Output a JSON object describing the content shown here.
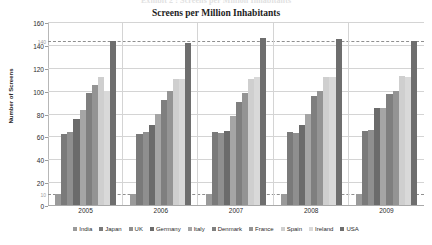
{
  "figure_caption": "Exhibit 2 : Screens per Million Inhabitants",
  "chart_data": {
    "type": "bar",
    "title": "Screens per Million Inhabitants",
    "xlabel": "",
    "ylabel": "Number of Screens",
    "ylim": [
      0,
      160
    ],
    "ytick_step": 20,
    "yticks": [
      0,
      20,
      40,
      60,
      80,
      100,
      120,
      140,
      160
    ],
    "grid": true,
    "legend_position": "bottom",
    "categories": [
      "2005",
      "2006",
      "2007",
      "2008",
      "2009"
    ],
    "reference_lines": [
      {
        "label": "140",
        "value": 143,
        "style": "dashed"
      },
      {
        "label": "10",
        "value": 10,
        "style": "dashed"
      }
    ],
    "series": [
      {
        "name": "India",
        "color": "#9a9a9a",
        "values": [
          10,
          10,
          10,
          10,
          10
        ]
      },
      {
        "name": "Japan",
        "color": "#7a7a7a",
        "values": [
          62,
          62,
          64,
          64,
          65
        ]
      },
      {
        "name": "UK",
        "color": "#8f8f8f",
        "values": [
          64,
          64,
          63,
          63,
          66
        ]
      },
      {
        "name": "Germany",
        "color": "#6b6b6b",
        "values": [
          75,
          70,
          65,
          70,
          85
        ]
      },
      {
        "name": "Italy",
        "color": "#a5a5a5",
        "values": [
          83,
          80,
          78,
          80,
          85
        ]
      },
      {
        "name": "Denmark",
        "color": "#7f7f7f",
        "values": [
          98,
          92,
          90,
          95,
          97
        ]
      },
      {
        "name": "France",
        "color": "#949494",
        "values": [
          105,
          100,
          98,
          100,
          100
        ]
      },
      {
        "name": "Spain",
        "color": "#cfcfcf",
        "values": [
          112,
          110,
          110,
          112,
          113
        ]
      },
      {
        "name": "Ireland",
        "color": "#d9d9d9",
        "values": [
          100,
          110,
          112,
          112,
          112
        ]
      },
      {
        "name": "USA",
        "color": "#6e6e6e",
        "values": [
          143,
          142,
          146,
          145,
          143
        ]
      }
    ]
  }
}
